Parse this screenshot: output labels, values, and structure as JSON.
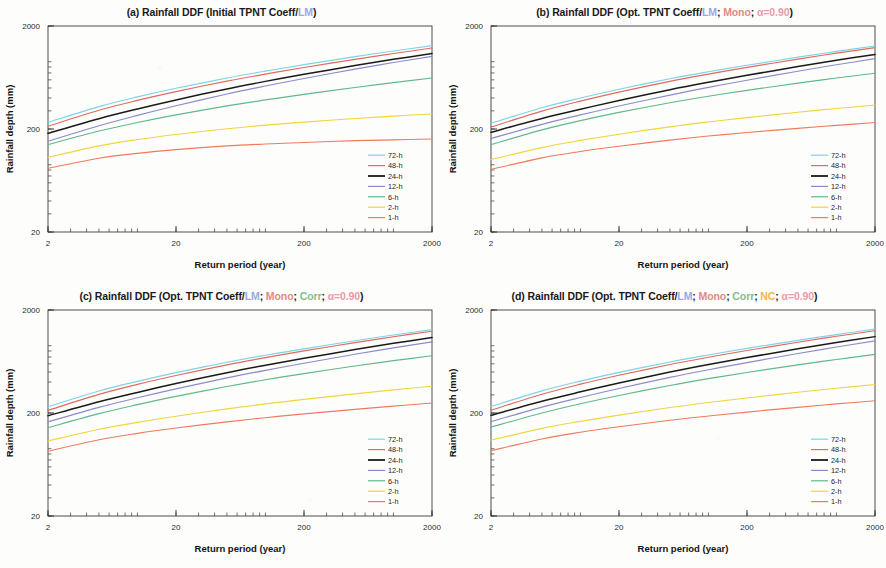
{
  "figure": {
    "background": "#fdfdfc",
    "axis_color": "#3a3a3a",
    "panel_count": 4
  },
  "common": {
    "xlabel": "Return period (year)",
    "ylabel": "Rainfall depth (mm)",
    "xticks": [
      "2",
      "20",
      "200",
      "2000"
    ],
    "yticks": [
      "20",
      "200",
      "2000"
    ],
    "xlim": [
      2,
      2000
    ],
    "ylim": [
      20,
      2000
    ],
    "xscale": "log",
    "yscale": "log",
    "legend_position": "lower-right",
    "legend_entries": [
      {
        "label": "72-h",
        "color": "#7fd2e8"
      },
      {
        "label": "48-h",
        "color": "#e06b5e"
      },
      {
        "label": "24-h",
        "color": "#1a1a1a"
      },
      {
        "label": "12-h",
        "color": "#8a8ccb"
      },
      {
        "label": "6-h",
        "color": "#5fb98a"
      },
      {
        "label": "2-h",
        "color": "#f2d43c"
      },
      {
        "label": "1-h",
        "color": "#ef7b5c"
      }
    ]
  },
  "titles": {
    "a": {
      "id": "(a)",
      "segments": [
        {
          "text": "(a) Rainfall DDF (Initial TPNT Coeff/",
          "style": "plain"
        },
        {
          "text": "LM",
          "style": "lm"
        },
        {
          "text": ")",
          "style": "plain"
        }
      ]
    },
    "b": {
      "id": "(b)",
      "segments": [
        {
          "text": "(b) Rainfall DDF (Opt. TPNT Coeff/",
          "style": "plain"
        },
        {
          "text": "LM",
          "style": "lm"
        },
        {
          "text": "; ",
          "style": "plain"
        },
        {
          "text": "Mono",
          "style": "mono"
        },
        {
          "text": "; ",
          "style": "plain"
        },
        {
          "text": "α=0.90",
          "style": "alpha"
        },
        {
          "text": ")",
          "style": "plain"
        }
      ]
    },
    "c": {
      "id": "(c)",
      "segments": [
        {
          "text": "(c) Rainfall DDF (Opt. TPNT Coeff/",
          "style": "plain"
        },
        {
          "text": "LM",
          "style": "lm"
        },
        {
          "text": "; ",
          "style": "plain"
        },
        {
          "text": "Mono",
          "style": "mono"
        },
        {
          "text": "; ",
          "style": "plain"
        },
        {
          "text": "Corr",
          "style": "corr"
        },
        {
          "text": "; ",
          "style": "plain"
        },
        {
          "text": "α=0.90",
          "style": "alpha"
        },
        {
          "text": ")",
          "style": "plain"
        }
      ]
    },
    "d": {
      "id": "(d)",
      "segments": [
        {
          "text": "(d) Rainfall DDF (Opt. TPNT Coeff/",
          "style": "plain"
        },
        {
          "text": "LM",
          "style": "lm"
        },
        {
          "text": "; ",
          "style": "plain"
        },
        {
          "text": "Mono",
          "style": "mono"
        },
        {
          "text": "; ",
          "style": "plain"
        },
        {
          "text": "Corr",
          "style": "corr"
        },
        {
          "text": "; ",
          "style": "plain"
        },
        {
          "text": "NC",
          "style": "nc"
        },
        {
          "text": "; ",
          "style": "plain"
        },
        {
          "text": "α=0.90",
          "style": "alpha"
        },
        {
          "text": ")",
          "style": "plain"
        }
      ]
    }
  },
  "chart_data": [
    {
      "panel": "a",
      "type": "line",
      "title": "(a) Rainfall DDF (Initial TPNT Coeff/LM)",
      "xlabel": "Return period (year)",
      "ylabel": "Rainfall depth (mm)",
      "xscale": "log",
      "yscale": "log",
      "xlim": [
        2,
        2000
      ],
      "ylim": [
        20,
        2000
      ],
      "x": [
        2,
        5,
        10,
        20,
        50,
        100,
        200,
        500,
        1000,
        2000
      ],
      "series": [
        {
          "name": "72-h",
          "color": "#7fd2e8",
          "values": [
            232,
            330,
            410,
            497,
            625,
            730,
            843,
            1008,
            1145,
            1290
          ]
        },
        {
          "name": "48-h",
          "color": "#e06b5e",
          "values": [
            213,
            304,
            379,
            461,
            583,
            683,
            791,
            949,
            1081,
            1222
          ]
        },
        {
          "name": "24-h",
          "color": "#1a1a1a",
          "values": [
            182,
            252,
            313,
            383,
            490,
            580,
            679,
            825,
            949,
            1081
          ]
        },
        {
          "name": "12-h",
          "color": "#8a8ccb",
          "values": [
            152,
            215,
            271,
            336,
            437,
            523,
            619,
            762,
            884,
            1015
          ]
        },
        {
          "name": "6-h",
          "color": "#5fb98a",
          "values": [
            141,
            191,
            231,
            274,
            335,
            383,
            434,
            506,
            564,
            625
          ]
        },
        {
          "name": "2-h",
          "color": "#f2d43c",
          "values": [
            106,
            137,
            158,
            177,
            201,
            218,
            233,
            253,
            267,
            280
          ]
        },
        {
          "name": "1-h",
          "color": "#ef7b5c",
          "values": [
            83,
            104,
            116,
            126,
            137,
            143,
            148,
            154,
            157,
            160
          ]
        }
      ]
    },
    {
      "panel": "b",
      "type": "line",
      "title": "(b) Rainfall DDF (Opt. TPNT Coeff/LM; Mono; α=0.90)",
      "xlabel": "Return period (year)",
      "ylabel": "Rainfall depth (mm)",
      "xscale": "log",
      "yscale": "log",
      "xlim": [
        2,
        2000
      ],
      "ylim": [
        20,
        2000
      ],
      "x": [
        2,
        5,
        10,
        20,
        50,
        100,
        200,
        500,
        1000,
        2000
      ],
      "series": [
        {
          "name": "72-h",
          "color": "#7fd2e8",
          "values": [
            228,
            322,
            400,
            487,
            615,
            719,
            831,
            996,
            1133,
            1278
          ]
        },
        {
          "name": "48-h",
          "color": "#e06b5e",
          "values": [
            209,
            298,
            373,
            456,
            580,
            682,
            793,
            954,
            1090,
            1235
          ]
        },
        {
          "name": "24-h",
          "color": "#1a1a1a",
          "values": [
            186,
            253,
            311,
            378,
            481,
            568,
            664,
            807,
            929,
            1060
          ]
        },
        {
          "name": "12-h",
          "color": "#8a8ccb",
          "values": [
            162,
            222,
            274,
            334,
            427,
            507,
            595,
            728,
            841,
            964
          ]
        },
        {
          "name": "6-h",
          "color": "#5fb98a",
          "values": [
            141,
            196,
            241,
            290,
            360,
            416,
            474,
            558,
            625,
            695
          ]
        },
        {
          "name": "2-h",
          "color": "#f2d43c",
          "values": [
            101,
            132,
            155,
            178,
            210,
            234,
            258,
            291,
            316,
            342
          ]
        },
        {
          "name": "1-h",
          "color": "#ef7b5c",
          "values": [
            81,
            105,
            121,
            136,
            156,
            171,
            185,
            203,
            217,
            231
          ]
        }
      ]
    },
    {
      "panel": "c",
      "type": "line",
      "title": "(c) Rainfall DDF (Opt. TPNT Coeff/LM; Mono; Corr; α=0.90)",
      "xlabel": "Return period (year)",
      "ylabel": "Rainfall depth (mm)",
      "xscale": "log",
      "yscale": "log",
      "xlim": [
        2,
        2000
      ],
      "ylim": [
        20,
        2000
      ],
      "x": [
        2,
        5,
        10,
        20,
        50,
        100,
        200,
        500,
        1000,
        2000
      ],
      "series": [
        {
          "name": "72-h",
          "color": "#7fd2e8",
          "values": [
            230,
            327,
            406,
            493,
            622,
            727,
            840,
            1006,
            1144,
            1290
          ]
        },
        {
          "name": "48-h",
          "color": "#e06b5e",
          "values": [
            212,
            303,
            379,
            462,
            587,
            690,
            801,
            963,
            1100,
            1245
          ]
        },
        {
          "name": "24-h",
          "color": "#1a1a1a",
          "values": [
            188,
            257,
            317,
            386,
            492,
            581,
            679,
            825,
            949,
            1081
          ]
        },
        {
          "name": "12-h",
          "color": "#8a8ccb",
          "values": [
            164,
            227,
            281,
            343,
            438,
            519,
            608,
            743,
            858,
            982
          ]
        },
        {
          "name": "6-h",
          "color": "#5fb98a",
          "values": [
            144,
            197,
            241,
            290,
            362,
            421,
            483,
            572,
            644,
            720
          ]
        },
        {
          "name": "2-h",
          "color": "#f2d43c",
          "values": [
            107,
            139,
            162,
            186,
            219,
            245,
            271,
            307,
            335,
            364
          ]
        },
        {
          "name": "1-h",
          "color": "#ef7b5c",
          "values": [
            85,
            110,
            127,
            143,
            164,
            180,
            196,
            217,
            233,
            250
          ]
        }
      ]
    },
    {
      "panel": "d",
      "type": "line",
      "title": "(d) Rainfall DDF (Opt. TPNT Coeff/LM; Mono; Corr; NC; α=0.90)",
      "xlabel": "Return period (year)",
      "ylabel": "Rainfall depth (mm)",
      "xscale": "log",
      "yscale": "log",
      "xlim": [
        2,
        2000
      ],
      "ylim": [
        20,
        2000
      ],
      "x": [
        2,
        5,
        10,
        20,
        50,
        100,
        200,
        500,
        1000,
        2000
      ],
      "series": [
        {
          "name": "72-h",
          "color": "#7fd2e8",
          "values": [
            231,
            328,
            408,
            496,
            626,
            732,
            847,
            1015,
            1155,
            1303
          ]
        },
        {
          "name": "48-h",
          "color": "#e06b5e",
          "values": [
            213,
            304,
            381,
            465,
            591,
            695,
            808,
            972,
            1111,
            1258
          ]
        },
        {
          "name": "24-h",
          "color": "#1a1a1a",
          "values": [
            190,
            260,
            321,
            391,
            499,
            590,
            690,
            840,
            967,
            1103
          ]
        },
        {
          "name": "12-h",
          "color": "#8a8ccb",
          "values": [
            165,
            228,
            283,
            346,
            443,
            526,
            617,
            756,
            874,
            1002
          ]
        },
        {
          "name": "6-h",
          "color": "#5fb98a",
          "values": [
            146,
            200,
            246,
            296,
            370,
            431,
            495,
            587,
            662,
            741
          ]
        },
        {
          "name": "2-h",
          "color": "#f2d43c",
          "values": [
            109,
            142,
            166,
            191,
            226,
            253,
            280,
            318,
            348,
            378
          ]
        },
        {
          "name": "1-h",
          "color": "#ef7b5c",
          "values": [
            86,
            112,
            130,
            147,
            170,
            187,
            204,
            227,
            245,
            263
          ]
        }
      ]
    }
  ]
}
